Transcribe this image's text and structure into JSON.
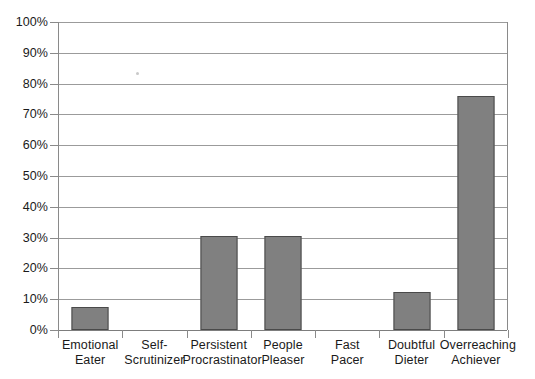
{
  "chart_data": {
    "type": "bar",
    "title": "",
    "xlabel": "",
    "ylabel": "",
    "categories": [
      "Emotional Eater",
      "Self-Scrutinizer",
      "Persistent Procrastinator",
      "People Pleaser",
      "Fast Pacer",
      "Doubtful Dieter",
      "Overreaching Achiever"
    ],
    "category_lines": [
      [
        "Emotional",
        "Eater"
      ],
      [
        "Self-",
        "Scrutinizer"
      ],
      [
        "Persistent",
        "Procrastinator"
      ],
      [
        "People",
        "Pleaser"
      ],
      [
        "Fast",
        "Pacer"
      ],
      [
        "Doubtful",
        "Dieter"
      ],
      [
        "Overreaching",
        "Achiever"
      ]
    ],
    "values": [
      7.5,
      0,
      30.5,
      30.5,
      0,
      12.5,
      76
    ],
    "ylim": [
      0,
      100
    ],
    "ytick_values": [
      0,
      10,
      20,
      30,
      40,
      50,
      60,
      70,
      80,
      90,
      100
    ],
    "ytick_labels": [
      "0%",
      "10%",
      "20%",
      "30%",
      "40%",
      "50%",
      "60%",
      "70%",
      "80%",
      "90%",
      "100%"
    ],
    "grid": true,
    "grid_axis": "y",
    "legend": false,
    "legend_position": "none",
    "bar_color": "#808080",
    "bar_edge_color": "#4a4a4a",
    "gridline_color": "#9b9b9b",
    "axis_color": "#8a8a8a",
    "text_color": "#1a1a1a",
    "background_color": "#ffffff"
  }
}
